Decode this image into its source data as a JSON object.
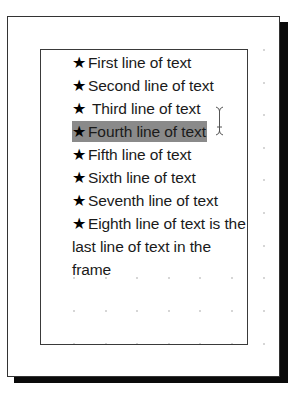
{
  "document": {
    "type": "page-layout-text-frame",
    "colors": {
      "page_background": "#ffffff",
      "page_shadow": "#0a0a0a",
      "frame_border": "#3a3a3a",
      "selection_highlight": "#8a8a8a",
      "grid_dot": "#c8c8c8",
      "text": "#1a1a1a"
    },
    "text_frame": {
      "bullet_icon": "star-icon",
      "bullet_glyph": "★",
      "lines": [
        {
          "text": "First line of text",
          "bullet": true,
          "selected": false
        },
        {
          "text": "Second line of text",
          "bullet": true,
          "selected": false
        },
        {
          "text": " Third line of text",
          "bullet": true,
          "selected": false
        },
        {
          "text": "Fourth line of text",
          "bullet": true,
          "selected": true
        },
        {
          "text": "Fifth line of text",
          "bullet": true,
          "selected": false
        },
        {
          "text": "Sixth line of text",
          "bullet": true,
          "selected": false
        },
        {
          "text": "Seventh line of text",
          "bullet": true,
          "selected": false
        },
        {
          "text": "Eighth line of text is the last line of text in the frame",
          "bullet": true,
          "selected": false
        }
      ]
    },
    "cursor": {
      "type": "i-beam",
      "icon": "text-cursor-icon"
    }
  }
}
